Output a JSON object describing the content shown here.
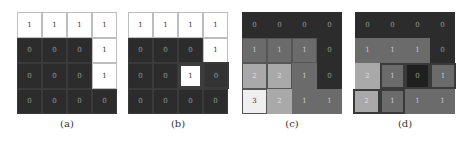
{
  "figures": [
    {
      "id": "a",
      "caption": "(a)",
      "style": "binary",
      "grid": [
        [
          "1",
          "1",
          "1",
          "1"
        ],
        [
          "0",
          "0",
          "0",
          "1"
        ],
        [
          "0",
          "0",
          "0",
          "1"
        ],
        [
          "0",
          "0",
          "0",
          "0"
        ]
      ]
    },
    {
      "id": "b",
      "caption": "(b)",
      "style": "binary",
      "grid": [
        [
          "1",
          "1",
          "1",
          "1"
        ],
        [
          "0",
          "0",
          "0",
          "1"
        ],
        [
          "0",
          "0",
          "1",
          "0"
        ],
        [
          "0",
          "0",
          "0",
          "0"
        ]
      ],
      "highlighted_cells": [
        [
          2,
          2
        ],
        [
          2,
          3
        ]
      ]
    },
    {
      "id": "c",
      "caption": "(c)",
      "style": "grayscale",
      "grid": [
        [
          "0",
          "0",
          "0",
          "0"
        ],
        [
          "1",
          "1",
          "1",
          "0"
        ],
        [
          "2",
          "2",
          "1",
          "0"
        ],
        [
          "3",
          "2",
          "1",
          "1"
        ]
      ]
    },
    {
      "id": "d",
      "caption": "(d)",
      "style": "grayscale",
      "grid": [
        [
          "0",
          "0",
          "0",
          "0"
        ],
        [
          "1",
          "1",
          "1",
          "0"
        ],
        [
          "2",
          "1",
          "0",
          "1"
        ],
        [
          "2",
          "1",
          "1",
          "1"
        ]
      ],
      "highlighted_cells": [
        [
          2,
          1
        ],
        [
          2,
          2
        ],
        [
          2,
          3
        ],
        [
          3,
          0
        ],
        [
          3,
          1
        ]
      ]
    }
  ],
  "colors": {
    "value_0": "#2c2c2c",
    "value_1": "#6b6b6b",
    "value_2": "#a9a9a9",
    "value_3": "#efefef",
    "binary_1": "#ffffff"
  }
}
